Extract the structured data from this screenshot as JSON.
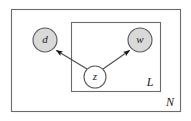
{
  "figure": {
    "kind": "plate-notation-graphical-model",
    "background_color": "#ffffff",
    "line_color": "#4d4d4d",
    "node_stroke_color": "#555555",
    "shaded_node_fill": "#d9d9d9",
    "unshaded_node_fill": "#ffffff",
    "arrow_color": "#1a1a1a"
  },
  "plates": [
    {
      "id": "outer-plate",
      "label": "N",
      "x": 11,
      "y": 9,
      "width": 170,
      "height": 103,
      "label_x": 170,
      "label_y": 103
    },
    {
      "id": "inner-plate",
      "label": "L",
      "x": 71,
      "y": 22,
      "width": 90,
      "height": 70,
      "label_x": 150,
      "label_y": 83
    }
  ],
  "nodes": [
    {
      "id": "node-d",
      "label": "d",
      "cx": 45,
      "cy": 40,
      "r": 12,
      "shaded": true,
      "fill": "#d9d9d9"
    },
    {
      "id": "node-w",
      "label": "w",
      "cx": 140,
      "cy": 40,
      "r": 12,
      "shaded": true,
      "fill": "#d9d9d9"
    },
    {
      "id": "node-z",
      "label": "z",
      "cx": 95,
      "cy": 77,
      "r": 11,
      "shaded": false,
      "fill": "#ffffff"
    }
  ],
  "edges": [
    {
      "id": "edge-z-to-d",
      "from": "node-z",
      "to": "node-d",
      "direction": "z-to-d",
      "x1": 87,
      "y1": 69,
      "x2": 54,
      "y2": 49
    },
    {
      "id": "edge-z-to-w",
      "from": "node-z",
      "to": "node-w",
      "direction": "z-to-w",
      "x1": 103,
      "y1": 69,
      "x2": 131,
      "y2": 49
    }
  ]
}
